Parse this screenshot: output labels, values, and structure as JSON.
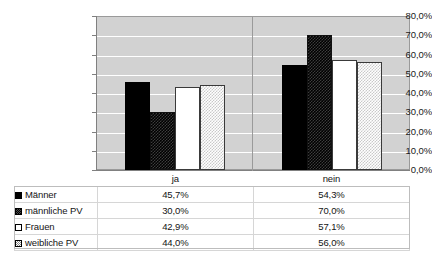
{
  "chart_data": {
    "type": "bar",
    "title": "",
    "xlabel": "",
    "ylabel": "",
    "categories": [
      "ja",
      "nein"
    ],
    "series": [
      {
        "name": "Männer",
        "values": [
          45.7,
          54.3
        ],
        "labels": [
          "45,7%",
          "54,3%"
        ],
        "swatch": "solid-black"
      },
      {
        "name": "männliche PV",
        "values": [
          30.0,
          70.0
        ],
        "labels": [
          "30,0%",
          "70,0%"
        ],
        "swatch": "dark-checker"
      },
      {
        "name": "Frauen",
        "values": [
          42.9,
          57.1
        ],
        "labels": [
          "42,9%",
          "57,1%"
        ],
        "swatch": "white"
      },
      {
        "name": "weibliche PV",
        "values": [
          44.0,
          56.0
        ],
        "labels": [
          "44,0%",
          "56,0%"
        ],
        "swatch": "light-checker"
      }
    ],
    "ylim": [
      0,
      80
    ],
    "ytick_values": [
      80,
      70,
      60,
      50,
      40,
      30,
      20,
      10,
      0
    ],
    "ytick_labels": [
      "80,0%",
      "70,0%",
      "60,0%",
      "50,0%",
      "40,0%",
      "30,0%",
      "20,0%",
      "10,0%",
      "0,0%"
    ],
    "grid": true,
    "legend_position": "bottom-table",
    "plot_background": "#d2d2d2",
    "gridline_color": "#ffffff"
  },
  "table": {
    "header": {
      "label": "",
      "columns": [
        "ja",
        "nein"
      ]
    },
    "rows": [
      {
        "label": "Männer",
        "ja": "45,7%",
        "nein": "54,3%"
      },
      {
        "label": "männliche PV",
        "ja": "30,0%",
        "nein": "70,0%"
      },
      {
        "label": "Frauen",
        "ja": "42,9%",
        "nein": "57,1%"
      },
      {
        "label": "weibliche PV",
        "ja": "44,0%",
        "nein": "56,0%"
      }
    ]
  }
}
